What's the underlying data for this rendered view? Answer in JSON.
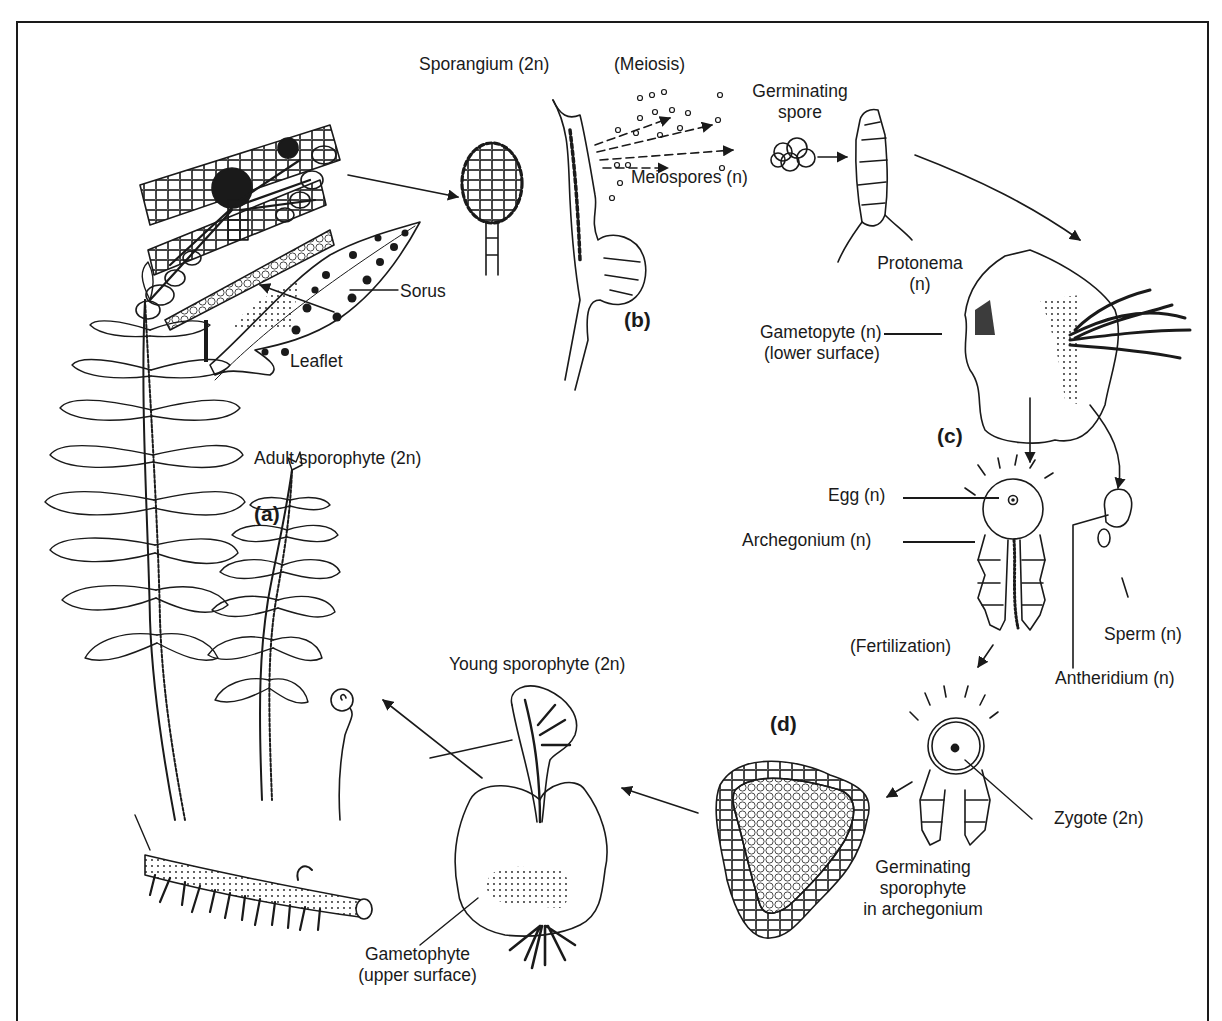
{
  "stages": {
    "a": "(a)",
    "b": "(b)",
    "c": "(c)",
    "d": "(d)"
  },
  "labels": {
    "sporangium": "Sporangium (2n)",
    "meiosis": "(Meiosis)",
    "germinating_spore_1": "Germinating",
    "germinating_spore_2": "spore",
    "meiospores": "Meiospores (n)",
    "sorus": "Sorus",
    "leaflet": "Leaflet",
    "protonema_1": "Protonema",
    "protonema_2": "(n)",
    "gametophyte_lower_1": "Gametopyte (n)",
    "gametophyte_lower_2": "(lower surface)",
    "adult_sporophyte": "Adult sporophyte (2n)",
    "egg": "Egg (n)",
    "archegonium": "Archegonium (n)",
    "sperm": "Sperm (n)",
    "antheridium": "Antheridium (n)",
    "fertilization": "(Fertilization)",
    "young_sporophyte": "Young sporophyte (2n)",
    "zygote": "Zygote (2n)",
    "germinating_sporophyte_1": "Germinating",
    "germinating_sporophyte_2": "sporophyte",
    "germinating_sporophyte_3": "in archegonium",
    "gametophyte_upper_1": "Gametophyte",
    "gametophyte_upper_2": "(upper surface)"
  },
  "colors": {
    "ink": "#1a1a1a",
    "background": "#ffffff"
  }
}
